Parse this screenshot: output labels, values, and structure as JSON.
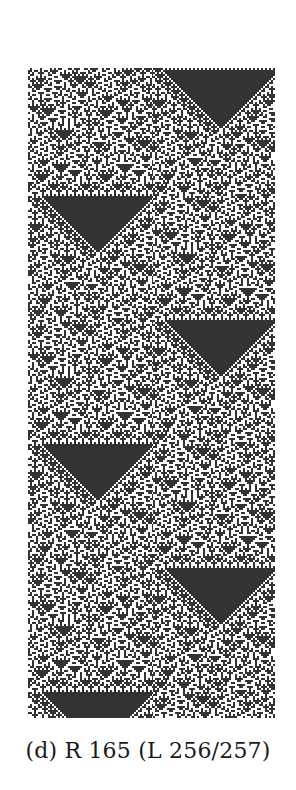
{
  "figure": {
    "panel_label": "(d)",
    "caption": "(d) R 165 (L 256/257)",
    "rule_number": 165,
    "lattice_note": "L 256/257",
    "colors": {
      "background": "#ffffff",
      "cell_on": "#333333",
      "cell_off": "#ffffff",
      "caption_text": "#1a1a1a"
    }
  },
  "ca": {
    "rule": 165,
    "width_cells": 124,
    "height_cells": 325,
    "initial_dark_block_fraction": 0.42
  }
}
